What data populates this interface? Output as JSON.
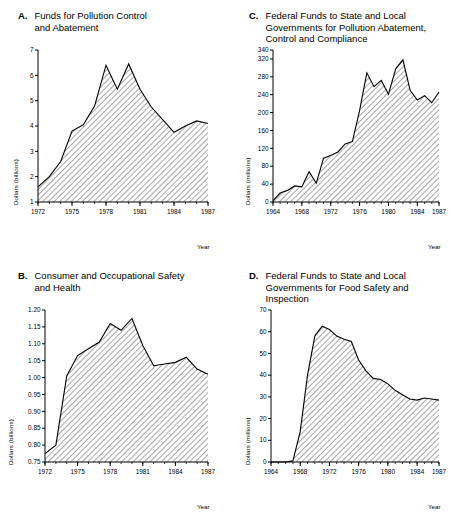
{
  "figure": {
    "background": "#ffffff",
    "ink": "#000000",
    "hatch_angle_deg": 45
  },
  "panels": [
    {
      "id": "A",
      "letter": "A.",
      "title": "Funds for Pollution Control and Abatement",
      "title_lines": [
        "Funds for Pollution Control",
        "and Abatement"
      ],
      "ylabel": "Dollars (billions)",
      "xlabel": "Year",
      "chart_data": {
        "type": "area",
        "title": "Funds for Pollution Control and Abatement",
        "xlabel": "Year",
        "ylabel": "Dollars (billions)",
        "xlim": [
          1972,
          1987
        ],
        "ylim": [
          1,
          7
        ],
        "ytick_labels": [
          "1",
          "2",
          "3",
          "4",
          "5",
          "6",
          "7"
        ],
        "yticks": [
          1,
          2,
          3,
          4,
          5,
          6,
          7
        ],
        "xtick_labels": [
          "1972",
          "1975",
          "1978",
          "1981",
          "1984",
          "1987"
        ],
        "xticks": [
          1972,
          1975,
          1978,
          1981,
          1984,
          1987
        ],
        "minor_xticks": true,
        "grid": false,
        "legend": null,
        "x": [
          1972,
          1973,
          1974,
          1975,
          1976,
          1977,
          1978,
          1979,
          1980,
          1981,
          1982,
          1983,
          1984,
          1985,
          1986,
          1987
        ],
        "values": [
          1.6,
          2.0,
          2.6,
          3.8,
          4.05,
          4.8,
          6.4,
          5.45,
          6.45,
          5.45,
          4.75,
          4.25,
          3.75,
          4.0,
          4.2,
          4.1
        ]
      }
    },
    {
      "id": "B",
      "letter": "B.",
      "title": "Consumer and Occupational Safety and Health",
      "title_lines": [
        "Consumer and Occupational Safety",
        "and Health"
      ],
      "ylabel": "Dollars (billions)",
      "xlabel": "Year",
      "chart_data": {
        "type": "area",
        "title": "Consumer and Occupational Safety and Health",
        "xlabel": "Year",
        "ylabel": "Dollars (billions)",
        "xlim": [
          1972,
          1987
        ],
        "ylim": [
          0.75,
          1.2
        ],
        "ytick_labels": [
          "0.75",
          "0.80",
          "0.85",
          "0.90",
          "0.95",
          "1.00",
          "1.05",
          "1.10",
          "1.15",
          "1.20"
        ],
        "yticks": [
          0.75,
          0.8,
          0.85,
          0.9,
          0.95,
          1.0,
          1.05,
          1.1,
          1.15,
          1.2
        ],
        "xtick_labels": [
          "1972",
          "1975",
          "1978",
          "1981",
          "1984",
          "1987"
        ],
        "xticks": [
          1972,
          1975,
          1978,
          1981,
          1984,
          1987
        ],
        "minor_xticks": true,
        "grid": false,
        "legend": null,
        "x": [
          1972,
          1973,
          1974,
          1975,
          1976,
          1977,
          1978,
          1979,
          1980,
          1981,
          1982,
          1983,
          1984,
          1985,
          1986,
          1987
        ],
        "values": [
          0.775,
          0.8,
          1.005,
          1.065,
          1.085,
          1.105,
          1.16,
          1.14,
          1.175,
          1.095,
          1.035,
          1.04,
          1.045,
          1.06,
          1.025,
          1.01
        ]
      }
    },
    {
      "id": "C",
      "letter": "C.",
      "title": "Federal Funds to State and Local Governments for Pollution Abatement, Control and Compliance",
      "title_lines": [
        "Federal Funds to State and Local",
        "Governments for Pollution Abatement,",
        "Control and Compliance"
      ],
      "ylabel": "Dollars (millions)",
      "xlabel": "Year",
      "chart_data": {
        "type": "area",
        "title": "Federal Funds to State and Local Governments for Pollution Abatement, Control and Compliance",
        "xlabel": "Year",
        "ylabel": "Dollars (millions)",
        "xlim": [
          1964,
          1987
        ],
        "ylim": [
          0,
          340
        ],
        "ytick_labels": [
          "0",
          "40",
          "80",
          "120",
          "160",
          "200",
          "240",
          "280",
          "320",
          "340"
        ],
        "yticks": [
          0,
          40,
          80,
          120,
          160,
          200,
          240,
          280,
          320,
          340
        ],
        "xtick_labels": [
          "1964",
          "1968",
          "1972",
          "1976",
          "1980",
          "1984",
          "1987"
        ],
        "xticks": [
          1964,
          1968,
          1972,
          1976,
          1980,
          1984,
          1987
        ],
        "minor_xticks": true,
        "grid": false,
        "legend": null,
        "x": [
          1964,
          1965,
          1966,
          1967,
          1968,
          1969,
          1970,
          1971,
          1972,
          1973,
          1974,
          1975,
          1976,
          1977,
          1978,
          1979,
          1980,
          1981,
          1982,
          1983,
          1984,
          1985,
          1986,
          1987
        ],
        "values": [
          3,
          20,
          26,
          36,
          34,
          68,
          42,
          98,
          104,
          112,
          130,
          135,
          205,
          289,
          258,
          272,
          241,
          298,
          318,
          250,
          228,
          238,
          222,
          246
        ]
      }
    },
    {
      "id": "D",
      "letter": "D.",
      "title": "Federal Funds to State and Local Governments for Food Safety and Inspection",
      "title_lines": [
        "Federal Funds to State and Local",
        "Governments for Food Safety and",
        "Inspection"
      ],
      "ylabel": "Dollars (millions)",
      "xlabel": "Year",
      "chart_data": {
        "type": "area",
        "title": "Federal Funds to State and Local Governments for Food Safety and Inspection",
        "xlabel": "Year",
        "ylabel": "Dollars (millions)",
        "xlim": [
          1964,
          1987
        ],
        "ylim": [
          0,
          70
        ],
        "ytick_labels": [
          "0",
          "10",
          "20",
          "30",
          "40",
          "50",
          "60",
          "70"
        ],
        "yticks": [
          0,
          10,
          20,
          30,
          40,
          50,
          60,
          70
        ],
        "xtick_labels": [
          "1964",
          "1968",
          "1972",
          "1976",
          "1980",
          "1984",
          "1987"
        ],
        "xticks": [
          1964,
          1968,
          1972,
          1976,
          1980,
          1984,
          1987
        ],
        "minor_xticks": true,
        "grid": false,
        "legend": null,
        "x": [
          1964,
          1965,
          1966,
          1967,
          1968,
          1969,
          1970,
          1971,
          1972,
          1973,
          1974,
          1975,
          1976,
          1977,
          1978,
          1979,
          1980,
          1981,
          1982,
          1983,
          1984,
          1985,
          1986,
          1987
        ],
        "values": [
          0,
          0,
          0,
          0.5,
          14,
          40,
          58,
          62.5,
          61,
          58,
          56.5,
          55.5,
          47,
          42,
          38.5,
          38,
          36,
          33,
          31,
          29,
          28.5,
          29.5,
          29,
          28.5
        ]
      }
    }
  ]
}
